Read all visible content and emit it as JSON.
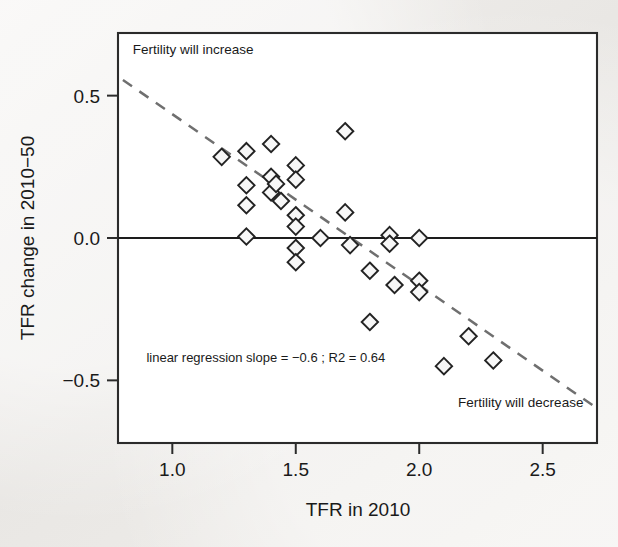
{
  "figure": {
    "background_color": "#eeecea",
    "plot_background_color": "#ffffff",
    "frame_color": "#2b2b2b",
    "marker_color": "#232323",
    "trend_color": "#6f6f6f"
  },
  "chart_data": {
    "type": "scatter",
    "title": "",
    "xlabel": "TFR in 2010",
    "ylabel": "TFR change in 2010−50",
    "xlim": [
      0.78,
      2.72
    ],
    "ylim": [
      -0.72,
      0.72
    ],
    "xticks": [
      1.0,
      1.5,
      2.0,
      2.5
    ],
    "xticklabels": [
      "1.0",
      "1.5",
      "2.0",
      "2.5"
    ],
    "yticks": [
      0.5,
      0.0,
      -0.5
    ],
    "yticklabels": [
      "0.5",
      "0.0",
      "−0.5"
    ],
    "grid": false,
    "legend": null,
    "zero_reference_line": 0.0,
    "annotations": [
      {
        "name": "top-left-note",
        "text": "Fertility will increase",
        "x": 0.84,
        "y": 0.645,
        "align": "start"
      },
      {
        "name": "bottom-right-note",
        "text": "Fertility will decrease",
        "x": 2.665,
        "y": -0.595,
        "align": "end"
      },
      {
        "name": "regression-note",
        "text": "linear regression slope = −0.6 ; R2 = 0.64",
        "x": 0.895,
        "y": -0.435,
        "align": "start"
      }
    ],
    "trend": {
      "name": "linear-regression-dashed-line",
      "slope": -0.6,
      "r_squared": 0.64,
      "x_start": 0.8,
      "y_start": 0.555,
      "x_end": 2.715,
      "y_end": -0.595,
      "style": "dashed"
    },
    "series": [
      {
        "name": "countries",
        "marker": "diamond",
        "points": [
          [
            1.2,
            0.285
          ],
          [
            1.3,
            0.305
          ],
          [
            1.3,
            0.185
          ],
          [
            1.3,
            0.115
          ],
          [
            1.3,
            0.005
          ],
          [
            1.4,
            0.33
          ],
          [
            1.4,
            0.215
          ],
          [
            1.4,
            0.16
          ],
          [
            1.42,
            0.19
          ],
          [
            1.44,
            0.13
          ],
          [
            1.5,
            0.255
          ],
          [
            1.5,
            0.205
          ],
          [
            1.5,
            0.08
          ],
          [
            1.5,
            0.04
          ],
          [
            1.5,
            -0.035
          ],
          [
            1.5,
            -0.085
          ],
          [
            1.6,
            0.0
          ],
          [
            1.7,
            0.375
          ],
          [
            1.7,
            0.09
          ],
          [
            1.72,
            -0.025
          ],
          [
            1.8,
            -0.115
          ],
          [
            1.8,
            -0.295
          ],
          [
            1.88,
            0.01
          ],
          [
            1.88,
            -0.02
          ],
          [
            1.9,
            -0.165
          ],
          [
            2.0,
            -0.15
          ],
          [
            2.0,
            -0.19
          ],
          [
            2.0,
            0.0
          ],
          [
            2.1,
            -0.45
          ],
          [
            2.2,
            -0.345
          ],
          [
            2.3,
            -0.43
          ]
        ]
      }
    ]
  }
}
